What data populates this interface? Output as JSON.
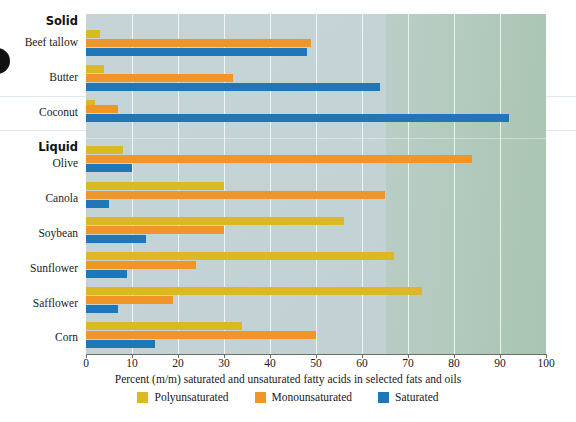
{
  "chart_data": {
    "type": "bar",
    "orientation": "horizontal",
    "title": "",
    "xlabel": "Percent (m/m) saturated and unsaturated fatty acids in selected fats and oils",
    "ylabel": "",
    "xlim": [
      0,
      100
    ],
    "xticks": [
      0,
      10,
      20,
      30,
      40,
      50,
      60,
      70,
      80,
      90,
      100
    ],
    "grid": true,
    "legend_position": "bottom",
    "groups": [
      {
        "name": "Solid",
        "categories": [
          "Beef tallow",
          "Butter",
          "Coconut"
        ]
      },
      {
        "name": "Liquid",
        "categories": [
          "Olive",
          "Canola",
          "Soybean",
          "Sunflower",
          "Safflower",
          "Corn"
        ]
      }
    ],
    "categories": [
      "Beef tallow",
      "Butter",
      "Coconut",
      "Olive",
      "Canola",
      "Soybean",
      "Sunflower",
      "Safflower",
      "Corn"
    ],
    "series": [
      {
        "name": "Polyunsaturated",
        "color": "#dcb924",
        "values": [
          3,
          4,
          2,
          8,
          30,
          56,
          67,
          73,
          34
        ]
      },
      {
        "name": "Monounsaturated",
        "color": "#f09628",
        "values": [
          49,
          32,
          7,
          84,
          65,
          30,
          24,
          19,
          50
        ]
      },
      {
        "name": "Saturated",
        "color": "#1f77b8",
        "values": [
          48,
          64,
          92,
          10,
          5,
          13,
          9,
          7,
          15
        ]
      }
    ]
  },
  "axis": {
    "tick_labels": [
      "0",
      "10",
      "20",
      "30",
      "40",
      "50",
      "60",
      "70",
      "80",
      "90",
      "100"
    ],
    "caption": "Percent (m/m) saturated and unsaturated fatty acids in selected fats and oils"
  },
  "legend": {
    "items": [
      {
        "label": "Polyunsaturated",
        "color": "#dcb924"
      },
      {
        "label": "Monounsaturated",
        "color": "#f09628"
      },
      {
        "label": "Saturated",
        "color": "#1f77b8"
      }
    ]
  },
  "labels": {
    "group_solid": "Solid",
    "group_liquid": "Liquid",
    "beef_tallow": "Beef tallow",
    "butter": "Butter",
    "coconut": "Coconut",
    "olive": "Olive",
    "canola": "Canola",
    "soybean": "Soybean",
    "sunflower": "Sunflower",
    "safflower": "Safflower",
    "corn": "Corn"
  }
}
